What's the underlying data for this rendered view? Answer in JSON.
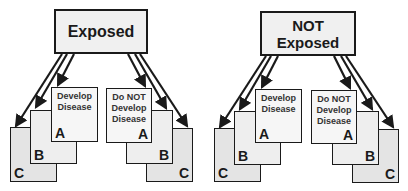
{
  "panels": [
    {
      "title": "Exposed",
      "left_stack": {
        "label": "Develop Disease",
        "cards": [
          "A",
          "B",
          "C"
        ]
      },
      "right_stack": {
        "label": "Do NOT Develop Disease",
        "cards": [
          "A",
          "B",
          "C"
        ]
      }
    },
    {
      "title": "NOT Exposed",
      "left_stack": {
        "label": "Develop Disease",
        "cards": [
          "A",
          "B",
          "C"
        ]
      },
      "right_stack": {
        "label": "Do NOT Develop Disease",
        "cards": [
          "A",
          "B",
          "C"
        ]
      }
    }
  ],
  "labels": {
    "develop_line1": "Develop",
    "develop_line2": "Disease",
    "donot_line1": "Do NOT",
    "donot_line2": "Develop",
    "donot_line3": "Disease",
    "exposed": "Exposed",
    "not": "NOT",
    "not_exposed_line2": "Exposed"
  },
  "colors": {
    "stroke": "#1a1a1a",
    "title_fill": "#f0f0f0",
    "card_a_fill": "#f6f6f6",
    "card_b_fill": "#eeeeee",
    "card_c_fill": "#e4e4e4"
  }
}
